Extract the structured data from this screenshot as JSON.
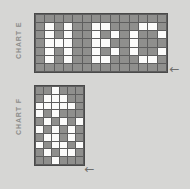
{
  "page": {
    "background_color": "#d6d6d4",
    "grid_line_color": "#5e5e5e",
    "cell_off_color": "#8f8f8d",
    "cell_on_color": "#fbfbfa",
    "label_color": "#8c8c8a",
    "arrow_color": "#6e6e6c"
  },
  "charts": [
    {
      "id": "chart-e",
      "label": "CHART E",
      "columns": 14,
      "rows": 7,
      "arrow_glyph": "←",
      "arrow_direction": "left",
      "grid": [
        [
          0,
          0,
          0,
          0,
          0,
          0,
          0,
          0,
          0,
          0,
          0,
          0,
          0,
          0
        ],
        [
          0,
          1,
          0,
          1,
          0,
          0,
          1,
          1,
          0,
          0,
          0,
          1,
          1,
          0
        ],
        [
          0,
          1,
          0,
          1,
          0,
          0,
          1,
          0,
          1,
          0,
          1,
          0,
          0,
          1
        ],
        [
          0,
          1,
          1,
          1,
          0,
          0,
          1,
          1,
          0,
          0,
          1,
          0,
          0,
          0
        ],
        [
          0,
          1,
          0,
          1,
          0,
          0,
          1,
          0,
          1,
          0,
          1,
          0,
          0,
          1
        ],
        [
          0,
          1,
          0,
          1,
          0,
          0,
          1,
          1,
          0,
          0,
          0,
          1,
          1,
          0
        ],
        [
          0,
          0,
          0,
          0,
          0,
          0,
          0,
          0,
          0,
          0,
          0,
          0,
          0,
          0
        ]
      ]
    },
    {
      "id": "chart-f",
      "label": "CHART F",
      "columns": 6,
      "rows": 10,
      "arrow_glyph": "←",
      "arrow_direction": "left",
      "grid": [
        [
          0,
          0,
          1,
          0,
          0,
          0
        ],
        [
          0,
          1,
          1,
          1,
          0,
          0
        ],
        [
          1,
          1,
          1,
          1,
          1,
          0
        ],
        [
          1,
          0,
          1,
          0,
          0,
          0
        ],
        [
          0,
          1,
          0,
          1,
          0,
          1
        ],
        [
          1,
          0,
          1,
          0,
          1,
          0
        ],
        [
          0,
          1,
          1,
          0,
          1,
          0
        ],
        [
          1,
          0,
          1,
          1,
          0,
          1
        ],
        [
          0,
          1,
          0,
          1,
          1,
          0
        ],
        [
          0,
          0,
          1,
          0,
          0,
          0
        ]
      ]
    }
  ]
}
